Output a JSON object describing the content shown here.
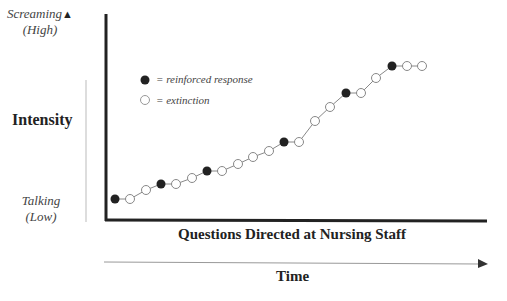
{
  "y_axis": {
    "top_label": "Screaming",
    "top_sub": "(High)",
    "title": "Intensity",
    "bottom_label": "Talking",
    "bottom_sub": "(Low)"
  },
  "x_axis": {
    "title": "Questions Directed at Nursing Staff",
    "time_label": "Time"
  },
  "legend": {
    "reinforced": "= reinforced response",
    "extinction": "= extinction"
  },
  "chart_data": {
    "type": "line",
    "title": "",
    "xlabel": "Questions Directed at Nursing Staff / Time",
    "ylabel": "Intensity (Talking, Low → Screaming, High)",
    "legend": [
      "reinforced response (filled)",
      "extinction (open)"
    ],
    "points": [
      {
        "x": 1,
        "y": 1,
        "type": "reinforced"
      },
      {
        "x": 2,
        "y": 1,
        "type": "extinction"
      },
      {
        "x": 3,
        "y": 2,
        "type": "extinction"
      },
      {
        "x": 4,
        "y": 2.5,
        "type": "reinforced"
      },
      {
        "x": 5,
        "y": 2.5,
        "type": "extinction"
      },
      {
        "x": 6,
        "y": 3,
        "type": "extinction"
      },
      {
        "x": 7,
        "y": 3.5,
        "type": "reinforced"
      },
      {
        "x": 8,
        "y": 3.5,
        "type": "extinction"
      },
      {
        "x": 9,
        "y": 4,
        "type": "extinction"
      },
      {
        "x": 10,
        "y": 4.5,
        "type": "extinction"
      },
      {
        "x": 11,
        "y": 5,
        "type": "extinction"
      },
      {
        "x": 12,
        "y": 5.5,
        "type": "reinforced"
      },
      {
        "x": 13,
        "y": 5.5,
        "type": "extinction"
      },
      {
        "x": 14,
        "y": 7,
        "type": "extinction"
      },
      {
        "x": 15,
        "y": 8,
        "type": "extinction"
      },
      {
        "x": 16,
        "y": 9,
        "type": "reinforced"
      },
      {
        "x": 17,
        "y": 9,
        "type": "extinction"
      },
      {
        "x": 18,
        "y": 10,
        "type": "extinction"
      },
      {
        "x": 19,
        "y": 11,
        "type": "reinforced"
      },
      {
        "x": 20,
        "y": 11,
        "type": "extinction"
      },
      {
        "x": 21,
        "y": 11,
        "type": "extinction"
      }
    ],
    "pixel_points": [
      [
        115,
        199,
        1
      ],
      [
        130,
        199,
        0
      ],
      [
        146,
        190,
        0
      ],
      [
        161,
        184,
        1
      ],
      [
        176,
        184,
        0
      ],
      [
        192,
        178,
        0
      ],
      [
        207,
        171,
        1
      ],
      [
        222,
        171,
        0
      ],
      [
        238,
        164,
        0
      ],
      [
        253,
        157,
        0
      ],
      [
        269,
        151,
        0
      ],
      [
        284,
        142,
        1
      ],
      [
        299,
        142,
        0
      ],
      [
        315,
        121,
        0
      ],
      [
        330,
        107,
        0
      ],
      [
        346,
        93,
        1
      ],
      [
        361,
        93,
        0
      ],
      [
        376,
        78,
        0
      ],
      [
        392,
        66,
        1
      ],
      [
        407,
        66,
        0
      ],
      [
        422,
        66,
        0
      ]
    ],
    "grid": false
  }
}
